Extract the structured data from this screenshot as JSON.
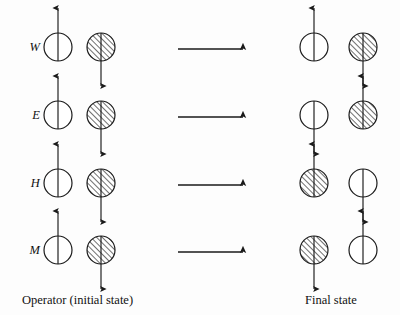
{
  "figure": {
    "title_present": false,
    "background_color": "#fdfdfd",
    "ink_color": "#1a1a1a",
    "captions": {
      "left": "Operator (initial state)",
      "right": "Final state"
    },
    "row_labels": [
      "W",
      "E",
      "H",
      "M"
    ],
    "geometry": {
      "circle_radius": 14,
      "left_white_cx": 58,
      "left_shaded_cx": 101,
      "right_white_cx": 314,
      "right_shaded_cx": 363,
      "row_cy": [
        47,
        115,
        183,
        250
      ],
      "arrow_x_start": 178,
      "arrow_x_end": 243,
      "label_x": 14,
      "caption_left_x": 22,
      "caption_right_x": 305,
      "caption_y": 300
    },
    "rows": [
      {
        "label": "W",
        "cy": 47,
        "initial": [
          {
            "fill": "white",
            "spin": "up",
            "slot": "left"
          },
          {
            "fill": "hatched",
            "spin": "down",
            "slot": "right"
          }
        ],
        "final": [
          {
            "fill": "white",
            "spin": "up",
            "slot": "left"
          },
          {
            "fill": "hatched",
            "spin": "down",
            "slot": "right"
          }
        ]
      },
      {
        "label": "E",
        "cy": 115,
        "initial": [
          {
            "fill": "white",
            "spin": "up",
            "slot": "left"
          },
          {
            "fill": "hatched",
            "spin": "down",
            "slot": "right"
          }
        ],
        "final": [
          {
            "fill": "white",
            "spin": "down",
            "slot": "left"
          },
          {
            "fill": "hatched",
            "spin": "up",
            "slot": "right"
          }
        ]
      },
      {
        "label": "H",
        "cy": 183,
        "initial": [
          {
            "fill": "white",
            "spin": "up",
            "slot": "left"
          },
          {
            "fill": "hatched",
            "spin": "down",
            "slot": "right"
          }
        ],
        "final": [
          {
            "fill": "hatched",
            "spin": "up",
            "slot": "left"
          },
          {
            "fill": "white",
            "spin": "down",
            "slot": "right"
          }
        ]
      },
      {
        "label": "M",
        "cy": 250,
        "initial": [
          {
            "fill": "white",
            "spin": "up",
            "slot": "left"
          },
          {
            "fill": "hatched",
            "spin": "down",
            "slot": "right"
          }
        ],
        "final": [
          {
            "fill": "hatched",
            "spin": "down",
            "slot": "left"
          },
          {
            "fill": "white",
            "spin": "up",
            "slot": "right"
          }
        ]
      }
    ]
  }
}
